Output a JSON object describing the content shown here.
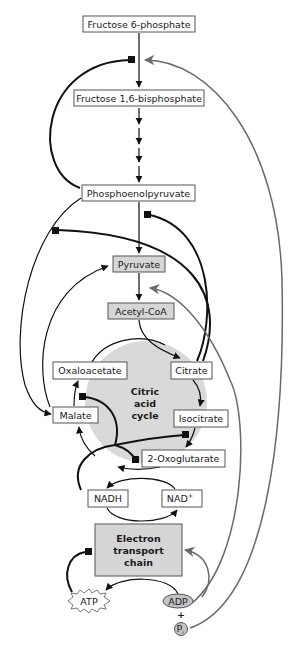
{
  "diagram": {
    "type": "metabolic-pathway",
    "colors": {
      "background": "#ffffff",
      "cycle_fill": "#d9d9d9",
      "highlight_box_fill": "#d6d6d6",
      "activation_arrow": "#6a6a6a",
      "inhibition_line": "#111111"
    },
    "nodes": {
      "f6p": "Fructose 6-phosphate",
      "f16bp": "Fructose 1,6-bisphosphate",
      "pep": "Phosphoenolpyruvate",
      "pyruvate": "Pyruvate",
      "acetyl_coa": "Acetyl-CoA",
      "oxaloacetate": "Oxaloacetate",
      "citrate": "Citrate",
      "malate": "Malate",
      "isocitrate": "Isocitrate",
      "oxoglutarate": "2-Oxoglutarate",
      "nadh": "NADH",
      "nad_plus": "NAD",
      "nad_plus_sup": "+",
      "etc_line1": "Electron",
      "etc_line2": "transport",
      "etc_line3": "chain",
      "atp": "ATP",
      "adp": "ADP",
      "plus": "+",
      "pi": "P",
      "pi_sub": "i"
    },
    "cycle_label": {
      "line1": "Citric",
      "line2": "acid",
      "line3": "cycle"
    },
    "legend_semantics": {
      "square_end": "inhibition",
      "gray_arrow": "activation",
      "black_arrow": "conversion"
    }
  }
}
